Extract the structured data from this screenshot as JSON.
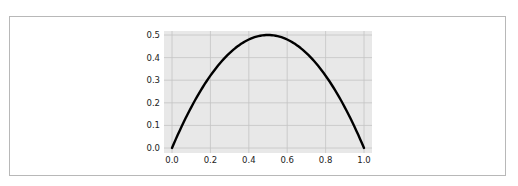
{
  "chart_data": {
    "type": "line",
    "title": "",
    "xlabel": "",
    "ylabel": "",
    "xlim": [
      0.0,
      1.0
    ],
    "ylim": [
      0.0,
      0.5
    ],
    "grid": true,
    "legend": null,
    "x_ticks": [
      "0.0",
      "0.2",
      "0.4",
      "0.6",
      "0.8",
      "1.0"
    ],
    "y_ticks": [
      "0.0",
      "0.1",
      "0.2",
      "0.3",
      "0.4",
      "0.5"
    ],
    "series": [
      {
        "name": "y = 2x(1-x)",
        "color": "#000000",
        "x": [
          0.0,
          0.05,
          0.1,
          0.15,
          0.2,
          0.25,
          0.3,
          0.35,
          0.4,
          0.45,
          0.5,
          0.55,
          0.6,
          0.65,
          0.7,
          0.75,
          0.8,
          0.85,
          0.9,
          0.95,
          1.0
        ],
        "y": [
          0.0,
          0.095,
          0.18,
          0.255,
          0.32,
          0.375,
          0.42,
          0.455,
          0.48,
          0.495,
          0.5,
          0.495,
          0.48,
          0.455,
          0.42,
          0.375,
          0.32,
          0.255,
          0.18,
          0.095,
          0.0
        ]
      }
    ]
  },
  "colors": {
    "plot_background": "#e8e8e8",
    "grid": "#c4c4c4",
    "line": "#000000",
    "frame_border": "#b8b8b8"
  }
}
